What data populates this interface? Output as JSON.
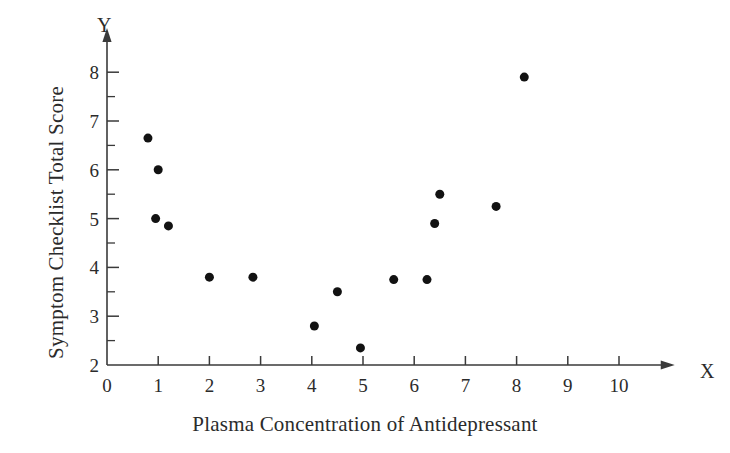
{
  "chart_data": {
    "type": "scatter",
    "title": "",
    "xlabel": "Plasma Concentration of Antidepressant",
    "ylabel": "Symptom Checklist Total Score",
    "x_axis_letter": "X",
    "y_axis_letter": "Y",
    "xlim": [
      0,
      10.6
    ],
    "ylim": [
      2,
      8.35
    ],
    "xticks": [
      0,
      1,
      2,
      3,
      4,
      5,
      6,
      7,
      8,
      9,
      10
    ],
    "xtick_labels": [
      "0",
      "1",
      "2",
      "3",
      "4",
      "5",
      "6",
      "7",
      "8",
      "9",
      "10"
    ],
    "yticks": [
      2,
      3,
      4,
      5,
      6,
      7,
      8
    ],
    "ytick_labels": [
      "2",
      "3",
      "4",
      "5",
      "6",
      "7",
      "8"
    ],
    "y_minor_ticks": [
      2.5,
      3.5,
      4.5,
      5.5,
      6.5,
      7.5
    ],
    "grid": false,
    "legend": null,
    "marker": "filled-circle",
    "marker_color": "#121212",
    "marker_size": 9,
    "axis_color": "#3a3a3a",
    "background_color": "#ffffff",
    "points": [
      {
        "x": 0.8,
        "y": 6.65
      },
      {
        "x": 1.0,
        "y": 6.0
      },
      {
        "x": 0.95,
        "y": 5.0
      },
      {
        "x": 1.2,
        "y": 4.85
      },
      {
        "x": 2.0,
        "y": 3.8
      },
      {
        "x": 2.85,
        "y": 3.8
      },
      {
        "x": 4.05,
        "y": 2.8
      },
      {
        "x": 4.5,
        "y": 3.5
      },
      {
        "x": 4.95,
        "y": 2.35
      },
      {
        "x": 5.6,
        "y": 3.75
      },
      {
        "x": 6.25,
        "y": 3.75
      },
      {
        "x": 6.4,
        "y": 4.9
      },
      {
        "x": 6.5,
        "y": 5.5
      },
      {
        "x": 7.6,
        "y": 5.25
      },
      {
        "x": 8.15,
        "y": 7.9
      }
    ],
    "n_points": 15
  }
}
